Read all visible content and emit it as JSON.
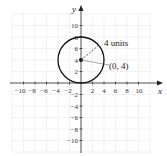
{
  "figure": {
    "x_axis_label": "x",
    "y_axis_label": "y",
    "x_ticks": [
      "−10",
      "−8",
      "−6",
      "−4",
      "−2",
      "2",
      "4",
      "6",
      "8",
      "10"
    ],
    "y_ticks": [
      "10",
      "8",
      "6",
      "4",
      "2",
      "−2",
      "−4",
      "−6",
      "−8",
      "−10"
    ],
    "circle": {
      "center": [
        0,
        4
      ],
      "radius": 4
    },
    "radius_label": "4 units",
    "center_label": "(0, 4)",
    "colors": {
      "grid": "#dcdcdc",
      "axis": "#222222",
      "circle": "#111111"
    }
  }
}
